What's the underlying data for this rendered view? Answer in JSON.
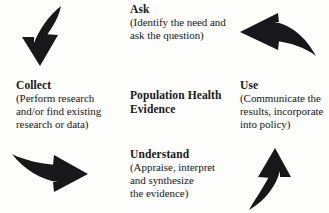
{
  "diagram": {
    "center": {
      "line1": "Population Health",
      "line2": "Evidence"
    },
    "ink_color": "#18181a",
    "background_color": "#fdfdfb",
    "nodes": {
      "ask": {
        "title": "Ask",
        "desc_line1": "(Identify the need and",
        "desc_line2": "ask the question)"
      },
      "collect": {
        "title": "Collect",
        "desc_line1": "(Perform research",
        "desc_line2": "and/or find existing",
        "desc_line3": "research or data)"
      },
      "use": {
        "title": "Use",
        "desc_line1": "(Communicate the",
        "desc_line2": "results, incorporate",
        "desc_line3": "into policy)"
      },
      "understand": {
        "title": "Understand",
        "desc_line1": "(Appraise, interpret",
        "desc_line2": "and synthesize",
        "desc_line3": "the evidence)"
      }
    },
    "arrows": {
      "collect_to_ask": "curved-arrow-down",
      "ask_to_use": "curved-arrow-left",
      "understand_to_collect": "curved-arrow-right",
      "use_to_understand": "curved-arrow-up"
    }
  }
}
